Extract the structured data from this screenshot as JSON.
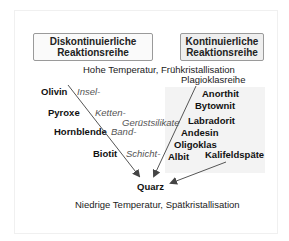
{
  "headers": {
    "discontinuous": "Diskontinuierliche\nReaktionsreihe",
    "continuous": "Kontinuierliche\nReaktionsreihe"
  },
  "temperature": {
    "high": "Hohe Temperatur, Frühkristallisation",
    "low": "Niedrige Temperatur, Spätkristallisation"
  },
  "discontinuous_minerals": [
    "Olivin",
    "Pyroxe",
    "Hornblende",
    "Biotit"
  ],
  "silicate_types": [
    "Insel-",
    "Ketten-",
    "Gerüstsilikate",
    "Band-",
    "Schicht-"
  ],
  "plagioclase_series_label": "Plagioklasreihe",
  "plagioclase_minerals": [
    "Anorthit",
    "Bytownit",
    "Labradorit",
    "Andesin",
    "Oligoklas",
    "Albit"
  ],
  "kalifeldspar": "Kalifeldspäte",
  "quartz": "Quarz"
}
